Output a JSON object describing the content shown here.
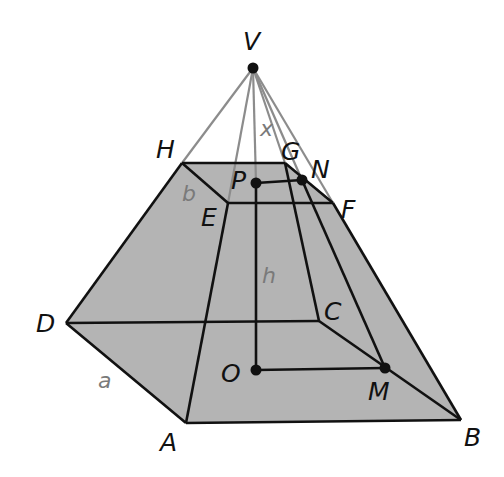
{
  "diagram": {
    "colors": {
      "face_fill": "#b4b4b4",
      "edge": "#111111",
      "apex_line": "#8c8c8c",
      "point": "#111111",
      "label": "#111111",
      "measure_label": "#7a7a7a"
    },
    "points": {
      "V": {
        "x": 253,
        "y": 68
      },
      "H": {
        "x": 182,
        "y": 163
      },
      "G": {
        "x": 285,
        "y": 163
      },
      "E": {
        "x": 228,
        "y": 203
      },
      "F": {
        "x": 333,
        "y": 203
      },
      "P": {
        "x": 256,
        "y": 183
      },
      "N": {
        "x": 302,
        "y": 180
      },
      "D": {
        "x": 66,
        "y": 323
      },
      "C": {
        "x": 319,
        "y": 321
      },
      "A": {
        "x": 186,
        "y": 423
      },
      "B": {
        "x": 461,
        "y": 420
      },
      "O": {
        "x": 256,
        "y": 370
      },
      "M": {
        "x": 385,
        "y": 368
      }
    },
    "labels": {
      "V": "V",
      "H": "H",
      "G": "G",
      "N": "N",
      "P": "P",
      "E": "E",
      "F": "F",
      "D": "D",
      "C": "C",
      "O": "O",
      "M": "M",
      "A": "A",
      "B": "B"
    },
    "measures": {
      "slant_top": "x",
      "top_side": "b",
      "height": "h",
      "base_side": "a"
    },
    "marked_points": [
      "V",
      "P",
      "N",
      "O",
      "M"
    ]
  }
}
